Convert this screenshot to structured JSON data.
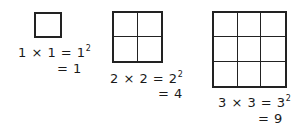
{
  "diagram": {
    "items": [
      {
        "n": 1,
        "grid_size": 1,
        "line1": {
          "lhs": "1 × 1 = 1",
          "exp": "2"
        },
        "line2": "= 1"
      },
      {
        "n": 2,
        "grid_size": 2,
        "line1": {
          "lhs": "2 × 2 = 2",
          "exp": "2"
        },
        "line2": "= 4"
      },
      {
        "n": 3,
        "grid_size": 3,
        "line1": {
          "lhs": "3 × 3 = 3",
          "exp": "2"
        },
        "line2": "= 9"
      }
    ],
    "colors": {
      "stroke": "#222222",
      "text": "#1a1a1a",
      "background": "#ffffff"
    }
  }
}
